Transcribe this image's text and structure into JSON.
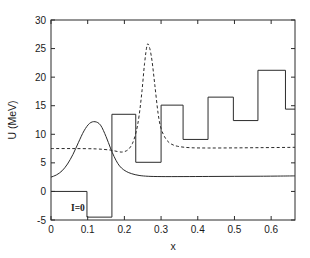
{
  "figure": {
    "annotation": "I=0"
  },
  "chart_data": {
    "type": "line",
    "title": "",
    "subtitle": "",
    "xlabel": "x",
    "ylabel": "U (MeV)",
    "xlim": [
      0,
      0.665
    ],
    "ylim": [
      -5,
      30
    ],
    "grid": false,
    "legend": "none",
    "annotations": [
      {
        "text": "I=0",
        "x": 0.055,
        "y": -2.3
      }
    ],
    "xticks": [
      0,
      0.1,
      0.2,
      0.3,
      0.4,
      0.5,
      0.6
    ],
    "xtick_labels": [
      "0",
      "0.1",
      "0.2",
      "0.3",
      "0.4",
      "0.5",
      "0.6"
    ],
    "yticks": [
      -5,
      0,
      5,
      10,
      15,
      20,
      25,
      30
    ],
    "ytick_labels": [
      "-5",
      "0",
      "5",
      "10",
      "15",
      "20",
      "25",
      "30"
    ],
    "series": [
      {
        "name": "step-potential",
        "style": "solid",
        "type": "step",
        "comment": "piecewise constant staircase, values in MeV over x intervals",
        "steps": [
          {
            "x0": 0.0,
            "x1": 0.098,
            "value": 0.0
          },
          {
            "x0": 0.098,
            "x1": 0.166,
            "value": -4.5
          },
          {
            "x0": 0.166,
            "x1": 0.231,
            "value": 13.5
          },
          {
            "x0": 0.231,
            "x1": 0.3,
            "value": 5.1
          },
          {
            "x0": 0.3,
            "x1": 0.36,
            "value": 15.1
          },
          {
            "x0": 0.36,
            "x1": 0.428,
            "value": 9.1
          },
          {
            "x0": 0.428,
            "x1": 0.497,
            "value": 16.5
          },
          {
            "x0": 0.497,
            "x1": 0.564,
            "value": 12.4
          },
          {
            "x0": 0.564,
            "x1": 0.639,
            "value": 21.2
          },
          {
            "x0": 0.639,
            "x1": 0.665,
            "value": 14.4
          }
        ]
      },
      {
        "name": "smooth-potential",
        "style": "solid",
        "type": "curve",
        "comment": "smooth curve: rises from 2.5 to hump 12.2 at x=0.12 then falls to plateau 2.7",
        "x": [
          0.0,
          0.015,
          0.03,
          0.045,
          0.06,
          0.075,
          0.09,
          0.105,
          0.12,
          0.135,
          0.15,
          0.162,
          0.172,
          0.182,
          0.192,
          0.205,
          0.22,
          0.24,
          0.265,
          0.3,
          0.36,
          0.43,
          0.5,
          0.57,
          0.64,
          0.665
        ],
        "y": [
          2.5,
          2.9,
          3.6,
          4.8,
          6.5,
          8.6,
          10.6,
          11.9,
          12.2,
          11.6,
          9.6,
          7.6,
          6.1,
          4.9,
          4.1,
          3.5,
          3.1,
          2.8,
          2.65,
          2.6,
          2.6,
          2.62,
          2.64,
          2.66,
          2.7,
          2.72
        ]
      },
      {
        "name": "mean-field-potential",
        "style": "dashed",
        "type": "curve",
        "comment": "dashed curve: flat near 7.5, dips to 6.9 near x=0.19, sharp peak 25.6 at x=0.262, settles to 7.7",
        "x": [
          0.0,
          0.06,
          0.12,
          0.16,
          0.18,
          0.195,
          0.21,
          0.222,
          0.232,
          0.24,
          0.248,
          0.255,
          0.262,
          0.268,
          0.275,
          0.283,
          0.292,
          0.3,
          0.312,
          0.325,
          0.345,
          0.38,
          0.43,
          0.5,
          0.57,
          0.64,
          0.665
        ],
        "y": [
          7.5,
          7.5,
          7.45,
          7.25,
          7.0,
          6.9,
          7.3,
          8.4,
          10.4,
          13.2,
          17.6,
          22.4,
          25.6,
          25.3,
          23.0,
          18.6,
          13.6,
          11.0,
          9.3,
          8.4,
          7.9,
          7.65,
          7.6,
          7.62,
          7.66,
          7.7,
          7.72
        ]
      }
    ]
  }
}
